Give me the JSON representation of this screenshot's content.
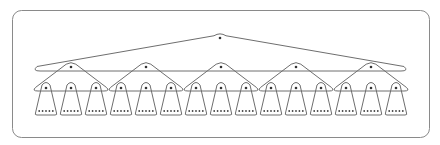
{
  "diagram": {
    "type": "hierarchical-tree",
    "colors": {
      "stroke": "#6e6e6e",
      "frame": "#8a8a8a",
      "dot": "#333333",
      "background": "#ffffff"
    },
    "frame": {
      "x": 12.5,
      "y": 10.5,
      "width": 417,
      "height": 127,
      "radius": 9
    },
    "root": {
      "apex": [
        220,
        33
      ],
      "left": 35,
      "right": 406,
      "base_y": 71,
      "dot": [
        220,
        38
      ]
    },
    "levels": {
      "root_count": 1,
      "mid_count": 5,
      "leaf_count": 15,
      "items_per_leaf": 5
    },
    "mid_nodes": [
      {
        "cx": 71,
        "apex_y": 62,
        "base_y": 91,
        "left": 34,
        "right": 108
      },
      {
        "cx": 146,
        "apex_y": 62,
        "base_y": 91,
        "left": 109,
        "right": 183
      },
      {
        "cx": 221,
        "apex_y": 62,
        "base_y": 91,
        "left": 184,
        "right": 258
      },
      {
        "cx": 296,
        "apex_y": 62,
        "base_y": 91,
        "left": 259,
        "right": 333
      },
      {
        "cx": 371,
        "apex_y": 62,
        "base_y": 91,
        "left": 334,
        "right": 408
      }
    ],
    "leaf": {
      "first_cx": 46,
      "spacing": 25,
      "top_y": 83,
      "bottom_y": 115,
      "top_half_width": 4,
      "bottom_half_width": 11,
      "dot_y": 88,
      "items_y": 111,
      "item_spacing": 3.4
    }
  }
}
